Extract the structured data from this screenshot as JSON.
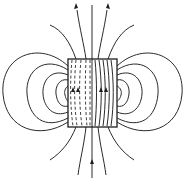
{
  "diagram": {
    "colors": {
      "ink": "#2a2a2a",
      "background": "#ffffff"
    },
    "magnet": {
      "x": 68,
      "y": 59,
      "width": 49,
      "height": 68
    },
    "outer_loops_left": [
      "M 68 66 C 40 40, 0 55, 3 94 C 6 130, 40 140, 68 122",
      "M 68 70 C 45 55, 25 70, 27 94 C 29 118, 45 130, 68 118",
      "M 68 75 C 52 68, 42 80, 43 94 C 44 108, 54 118, 68 112",
      "M 68 80 C 60 78, 55 86, 56 94 C 57 102, 61 108, 68 106",
      "M 68 86 C 65 88, 64 92, 65 95 C 66 99, 67 101, 68 101"
    ],
    "outer_loops_right": [
      "M 117 66 C 145 40, 185 55, 182 94 C 179 130, 145 140, 117 122",
      "M 117 70 C 140 55, 160 70, 158 94 C 156 118, 140 130, 117 118",
      "M 117 75 C 133 68, 143 80, 142 94 C 141 108, 131 118, 117 112",
      "M 117 80 C 125 78, 130 86, 129 94 C 128 102, 124 108, 117 106",
      "M 117 86 C 121 88, 122 92, 121 95 C 120 99, 118 101, 117 101"
    ],
    "open_lines": [
      "M 92 5 L 92 178",
      "M 77 10 C 80 30, 84 45, 86 59",
      "M 107 10 C 104 30, 100 45, 98 59",
      "M 50 25 C 62 30, 70 42, 76 59",
      "M 134 25 C 122 30, 114 42, 108 59",
      "M 86 127 C 84 145, 80 160, 78 175",
      "M 98 127 C 100 145, 104 160, 106 175",
      "M 76 127 C 70 142, 62 152, 50 160",
      "M 108 127 C 114 142, 122 152, 134 160"
    ],
    "interior_dashed": [
      "M 72 60 C 70 80, 70 105, 73 126",
      "M 76 60 C 74 80, 74 105, 77 126",
      "M 81 60 C 79 80, 79 105, 82 126",
      "M 86 60 C 85 80, 85 105, 87 126",
      "M 90 60 L 90 126"
    ],
    "interior_solid": [
      "M 95 60 C 97 80, 97 105, 95 126",
      "M 99 60 C 102 80, 102 105, 99 126",
      "M 103 60 C 106 80, 106 105, 103 126",
      "M 107 60 C 110 80, 110 105, 107 126",
      "M 111 60 C 114 80, 114 105, 111 126"
    ],
    "arrows": [
      {
        "name": "arrow-top-left",
        "points": "74,9 78,8 76,3"
      },
      {
        "name": "arrow-top-right",
        "points": "106,8 110,9 108,3"
      },
      {
        "name": "arrow-bottom-center",
        "points": "90,164 94,164 92,159"
      },
      {
        "name": "arrow-left-inside-1",
        "points": "71,92 75,92 73,87"
      },
      {
        "name": "arrow-left-inside-2",
        "points": "76,92 80,92 78,87"
      },
      {
        "name": "arrow-right-inside-1",
        "points": "99,92 103,92 101,87"
      },
      {
        "name": "arrow-right-inside-2",
        "points": "104,92 108,92 106,87"
      }
    ]
  }
}
